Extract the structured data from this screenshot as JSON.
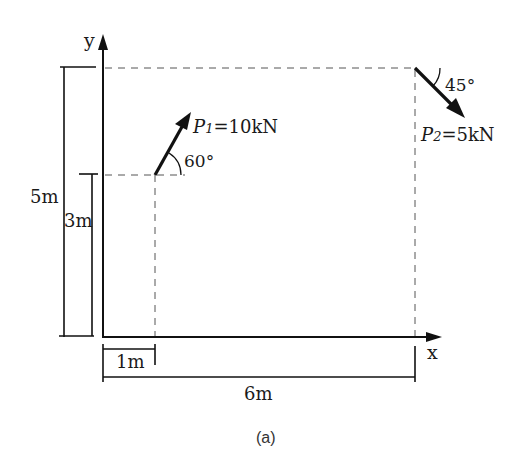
{
  "diagram": {
    "caption": "(a)",
    "axes": {
      "x_label": "x",
      "y_label": "y"
    },
    "forces": [
      {
        "name": "P",
        "subscript": "1",
        "value_text": "=10kN",
        "magnitude_kN": 10,
        "angle_label": "60°",
        "angle_deg": 60,
        "application_point_m": [
          1,
          3
        ],
        "direction": "up-right, 60° from horizontal"
      },
      {
        "name": "P",
        "subscript": "2",
        "value_text": "=5kN",
        "magnitude_kN": 5,
        "angle_label": "45°",
        "angle_deg": 45,
        "application_point_m": [
          6,
          5
        ],
        "direction": "down-right, 45° below horizontal"
      }
    ],
    "dimensions": {
      "height_total": "5m",
      "height_p1": "3m",
      "width_p1": "1m",
      "width_total": "6m"
    },
    "colors": {
      "line": "#111111",
      "dashed": "#555555",
      "background": "#ffffff"
    }
  }
}
